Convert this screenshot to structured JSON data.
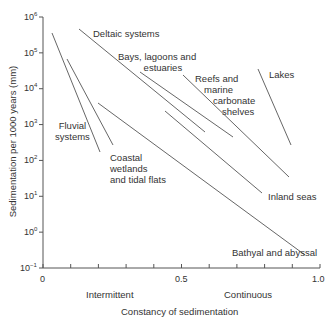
{
  "chart_data": {
    "type": "line",
    "title": "",
    "xlabel": "Constancy of sedimentation",
    "ylabel": "Sedimentation per 1000 years (mm)",
    "xlim": [
      0,
      1.0
    ],
    "ylim_log10": [
      -1,
      6
    ],
    "x_ticks": [
      "0",
      "0.5",
      "1.0"
    ],
    "x_minor_tick_step": 0.1,
    "y_ticks": [
      "10^6",
      "10^5",
      "10^4",
      "10^3",
      "10^2",
      "10^1",
      "10^0",
      "10^-1"
    ],
    "x_annotations": [
      {
        "text": "Intermittent",
        "x": 0.25
      },
      {
        "text": "Continuous",
        "x": 0.75
      }
    ],
    "grid": false,
    "series": [
      {
        "name": "Fluvial systems",
        "points": [
          [
            0.03,
            316000
          ],
          [
            0.21,
            150
          ]
        ]
      },
      {
        "name": "Coastal wetlands and tidal flats",
        "points": [
          [
            0.09,
            60000
          ],
          [
            0.25,
            250
          ]
        ]
      },
      {
        "name": "Deltaic systems",
        "points": [
          [
            0.13,
            400000
          ],
          [
            0.58,
            550
          ]
        ]
      },
      {
        "name": "Bays, lagoons and estuaries",
        "points": [
          [
            0.35,
            25000
          ],
          [
            0.69,
            400
          ]
        ]
      },
      {
        "name": "Inland seas",
        "points": [
          [
            0.44,
            2500
          ],
          [
            0.79,
            12
          ]
        ]
      },
      {
        "name": "Reefs and marine carbonate shelves",
        "points": [
          [
            0.51,
            20000
          ],
          [
            0.89,
            30
          ]
        ]
      },
      {
        "name": "Lakes",
        "points": [
          [
            0.78,
            30000
          ],
          [
            0.89,
            230
          ]
        ]
      },
      {
        "name": "Bathyal and abyssal",
        "points": [
          [
            0.2,
            3000
          ],
          [
            0.94,
            0.5
          ]
        ]
      }
    ]
  },
  "labels": {
    "fluvial": [
      "Fluvial",
      "systems"
    ],
    "coastal": [
      "Coastal",
      "wetlands",
      "and tidal flats"
    ],
    "deltaic": "Deltaic systems",
    "bays": [
      "Bays, lagoons and",
      "estuaries"
    ],
    "reefs": [
      "Reefs and",
      "marine",
      "carbonate",
      "shelves"
    ],
    "lakes": "Lakes",
    "inland": "Inland seas",
    "bathyal": "Bathyal and abyssal"
  },
  "colors": {
    "axis": "#555555",
    "line": "#555555",
    "text": "#333333"
  }
}
